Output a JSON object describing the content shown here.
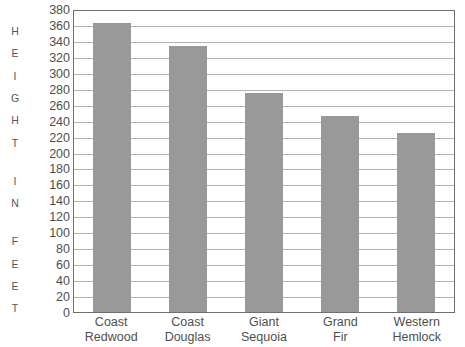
{
  "chart_data": {
    "type": "bar",
    "title": "",
    "xlabel": "",
    "ylabel": "HEIGHT IN FEET",
    "ylim": [
      0,
      380
    ],
    "ytick_step": 20,
    "grid": true,
    "legend": "none",
    "bar_color": "#999999",
    "categories": [
      "Coast Redwood",
      "Coast Douglas",
      "Giant Sequoia",
      "Grand Fir",
      "Western Hemlock"
    ],
    "category_lines": [
      [
        "Coast",
        "Redwood"
      ],
      [
        "Coast",
        "Douglas"
      ],
      [
        "Giant",
        "Sequoia"
      ],
      [
        "Grand",
        "Fir"
      ],
      [
        "Western",
        "Hemlock"
      ]
    ],
    "values": [
      363,
      333,
      275,
      246,
      224
    ],
    "yticks": [
      380,
      360,
      340,
      320,
      300,
      280,
      260,
      240,
      220,
      200,
      180,
      160,
      140,
      120,
      100,
      80,
      60,
      40,
      20,
      0
    ],
    "ylabel_letters": [
      "H",
      "E",
      "I",
      "G",
      "H",
      "T",
      " ",
      "I",
      "N",
      " ",
      "F",
      "E",
      "E",
      "T"
    ]
  },
  "colors": {
    "bar": "#999999",
    "gridline": "#b4b4b4",
    "axis": "#6e6e6e",
    "text": "#4f4f4f",
    "background": "#ffffff"
  }
}
